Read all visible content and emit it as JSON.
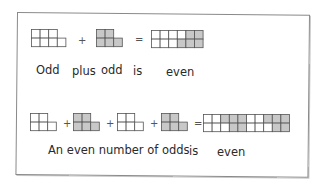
{
  "colors": {
    "cell_white": "#ffffff",
    "cell_gray": "#c8c8c8",
    "cell_line": "#555555",
    "frame": "#8a8a8a",
    "text": "#2a2a2a"
  },
  "row1": {
    "operators": {
      "plus": "+",
      "equals": "="
    },
    "figures": [
      {
        "name": "odd-7",
        "fill": "white",
        "top": [
          1,
          1,
          1
        ],
        "bottom": [
          1,
          1,
          1,
          1
        ]
      },
      {
        "name": "odd-5",
        "fill": "gray",
        "top": [
          1,
          1
        ],
        "bottom": [
          1,
          1,
          1
        ]
      }
    ],
    "result": {
      "name": "even-12",
      "top": [
        "W",
        "W",
        "W",
        "W",
        "G",
        "G"
      ],
      "bottom": [
        "W",
        "W",
        "W",
        "G",
        "G",
        "G"
      ]
    },
    "caption": {
      "w1": "Odd",
      "w2": "plus",
      "w3": "odd",
      "w4": "is",
      "w5": "even"
    }
  },
  "row2": {
    "operators": {
      "plus": "+",
      "equals": "="
    },
    "figures": [
      {
        "name": "odd-5-a",
        "fill": "white"
      },
      {
        "name": "odd-5-b",
        "fill": "gray"
      },
      {
        "name": "odd-5-c",
        "fill": "white"
      },
      {
        "name": "odd-5-d",
        "fill": "gray"
      }
    ],
    "result": {
      "name": "even-20",
      "top": [
        "W",
        "W",
        "G",
        "G",
        "G",
        "W",
        "W",
        "G",
        "G",
        "G"
      ],
      "bottom": [
        "W",
        "W",
        "W",
        "G",
        "G",
        "W",
        "W",
        "W",
        "G",
        "G"
      ]
    },
    "caption": {
      "phrase": "An even number of odds",
      "is": "is",
      "even": "even"
    }
  }
}
